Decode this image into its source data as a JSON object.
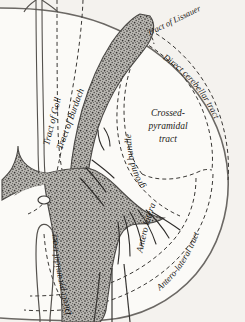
{
  "figure": {
    "background_color": "#f4f2ee",
    "ink_color": "#1c1a18",
    "gray_matter_color": "#8c8c88",
    "orientation": "right half of a transverse section, posterior at top, anterior at bottom"
  },
  "labels": {
    "tract_of_goll": "Tract of Goll",
    "tract_of_burdach": "Tract of Burdach",
    "tract_of_lissauer": "Tract of Lissauer",
    "direct_cerebellar_tract": "Direct cerebellar tract",
    "crossed_pyramidal_line1": "Crossed-",
    "crossed_pyramidal_line2": "pyramidal",
    "crossed_pyramidal_line3": "tract",
    "ground_bundle": "ground bundle",
    "antero_lateral_inner": "Antero lateral",
    "antero_lateral_tract": "Antero-lateral tract",
    "direct_pyramidal_tract": "Direct pyramidal tract"
  },
  "structures": {
    "posterior_median_fissure": "posterior-median-fissure",
    "central_canal": "central-canal",
    "gray_commissure": "gray-commissure",
    "posterior_horn": "posterior-horn",
    "anterior_horn": "anterior-horn",
    "anterior_nerve_roots": "anterior-nerve-roots",
    "posterior_nerve_roots": "posterior-nerve-roots",
    "anterior_median_fissure": "anterior-median-fissure",
    "cord_outline": "cord-outline"
  }
}
